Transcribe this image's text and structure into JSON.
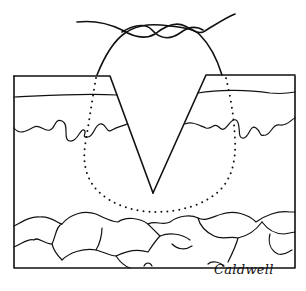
{
  "figure": {
    "type": "line-illustration",
    "signature": "Caldwell",
    "colors": {
      "ink": "#111111",
      "background": "#ffffff"
    },
    "elements": [
      "suture-knot",
      "suture-loop-dotted",
      "skin-block-left",
      "skin-block-right",
      "epidermis-line",
      "dermis-wavy-line",
      "v-incision",
      "fat-lobules-layer",
      "outer-frame"
    ]
  }
}
